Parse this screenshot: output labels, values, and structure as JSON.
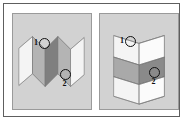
{
  "figure": {
    "panel_count": 2
  },
  "colors": {
    "page_background": "#ffffff",
    "outer_frame_border": "#5e5e5e",
    "panel_background": "#d2d2d2",
    "panel_border": "#9a9a9a",
    "facet_white": "#f4f4f4",
    "facet_light": "#e6e6e6",
    "facet_medium": "#b4b4b4",
    "facet_dark": "#8f8f8f",
    "facet_darkest": "#7a7a7a",
    "edge_stroke": "#6f6f6f",
    "marker_stroke": "#111111",
    "label_text": "#111111"
  },
  "panels": [
    {
      "id": "panel-left",
      "name": "left-panel",
      "orientation": "horizontal-fold",
      "description": "Accordion-folded surface seen with vertical fold lines running top to bottom; pleats alternate white, medium gray and dark gray.",
      "markers": [
        {
          "id": "marker-1-left",
          "label": "1",
          "label_position": "left",
          "target": "white-facet-upper-left",
          "x": 31,
          "y": 29
        },
        {
          "id": "marker-2-left",
          "label": "2",
          "label_position": "below",
          "target": "medium-gray-facet-lower-right",
          "x": 52,
          "y": 60
        }
      ]
    },
    {
      "id": "panel-right",
      "name": "right-panel",
      "orientation": "vertical-fold",
      "description": "Same accordion-folded surface rotated ninety degrees; fold lines run left to right with horizontal white, medium gray and dark gray bands.",
      "markers": [
        {
          "id": "marker-1-right",
          "label": "1",
          "label_position": "left",
          "target": "white-band-upper-left",
          "x": 30,
          "y": 27
        },
        {
          "id": "marker-2-right",
          "label": "2",
          "label_position": "below",
          "target": "medium-gray-band-lower-right",
          "x": 54,
          "y": 58
        }
      ]
    }
  ]
}
